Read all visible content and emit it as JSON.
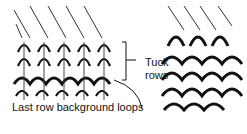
{
  "figure": {
    "labels": {
      "tuck_line1": "Tuck",
      "tuck_line2": "rows",
      "last_row": "Last row background loops"
    },
    "colors": {
      "ink": "#111111",
      "background": "#ffffff"
    }
  }
}
